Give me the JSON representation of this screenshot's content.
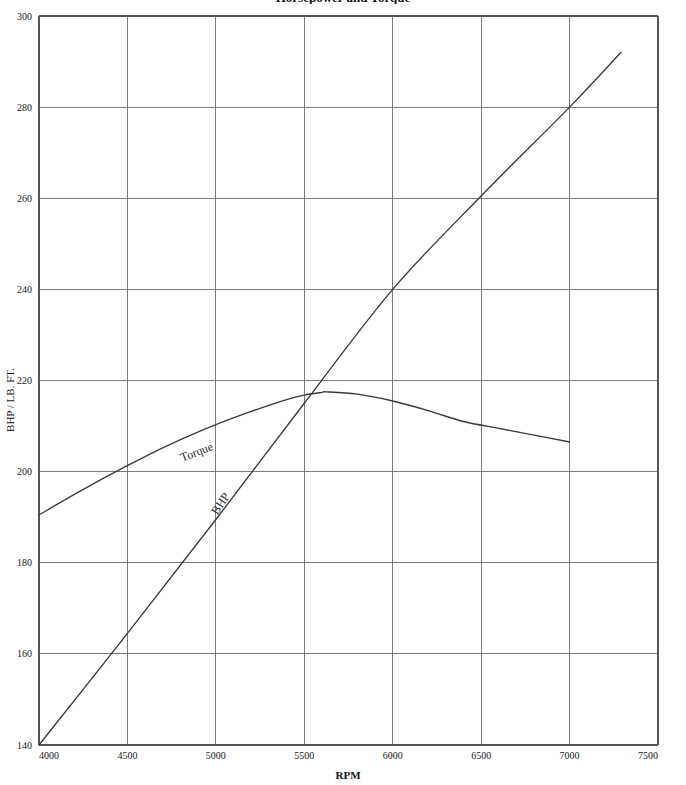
{
  "chart_data": {
    "type": "line",
    "title": "Horsepower and Torque",
    "xlabel": "RPM",
    "ylabel": "BHP / LB. FT.",
    "xlim": [
      4000,
      7500
    ],
    "ylim": [
      140,
      300
    ],
    "xticks": [
      4000,
      4500,
      5000,
      5500,
      6000,
      6500,
      7000,
      7500
    ],
    "xtick_labels": [
      "4000",
      "4500",
      "5000",
      "5500",
      "6000",
      "6500",
      "7000",
      "7500"
    ],
    "yticks": [
      140,
      160,
      180,
      200,
      220,
      240,
      260,
      280,
      300
    ],
    "ytick_labels": [
      "140",
      "160",
      "180",
      "200",
      "220",
      "240",
      "260",
      "280",
      "300"
    ],
    "grid": true,
    "legend": "inline-curve-labels",
    "series": [
      {
        "name": "Torque",
        "label": "Torque",
        "label_rotation": -21,
        "label_x": 4900,
        "label_y": 203.5,
        "color": "#3a3a3a",
        "x": [
          4000,
          4200,
          4400,
          4600,
          4800,
          5000,
          5200,
          5400,
          5500,
          5600,
          5625,
          5800,
          6000,
          6200,
          6400,
          6600,
          6800,
          7000
        ],
        "values": [
          190.5,
          195.0,
          199.3,
          203.3,
          207.0,
          210.3,
          213.2,
          215.8,
          216.8,
          217.4,
          217.5,
          217.0,
          215.5,
          213.4,
          211.0,
          209.5,
          208.0,
          206.5
        ]
      },
      {
        "name": "BHP",
        "label": "BHP",
        "label_rotation": -56,
        "label_x": 5045,
        "label_y": 192.5,
        "color": "#3a3a3a",
        "x": [
          4000,
          4500,
          5000,
          5500,
          6000,
          6500,
          7000,
          7290
        ],
        "values": [
          140.0,
          164.5,
          189.5,
          215.0,
          240.0,
          260.5,
          280.0,
          292.0
        ]
      }
    ],
    "annotations": [
      {
        "text": "Torque",
        "at_rpm": 4900,
        "at_value": 203.5
      },
      {
        "text": "BHP",
        "at_rpm": 5045,
        "at_value": 192.5
      }
    ],
    "colors": {
      "curve": "#3a3a3a",
      "grid": "#6e6e6e",
      "axis": "#555555",
      "text": "#1a1a1a",
      "background": "#ffffff"
    }
  }
}
